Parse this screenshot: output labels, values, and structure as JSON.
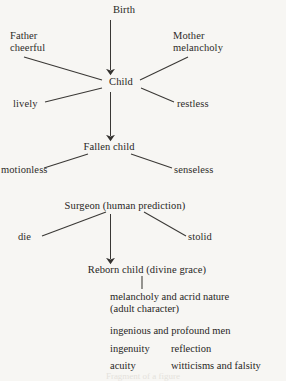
{
  "figure": {
    "type": "flow-diagram",
    "background_color": "#f7f6f3",
    "ink_color": "#282624",
    "nodes": {
      "birth": "Birth",
      "child": "Child",
      "fallen_child": "Fallen child",
      "surgeon": "Surgeon (human prediction)",
      "reborn_child": "Reborn child (divine grace)"
    },
    "branch_labels": {
      "father": "Father\ncheerful",
      "mother": "Mother\nmelancholy",
      "lively": "lively",
      "restless": "restless",
      "motionless": "motionless",
      "senseless": "senseless",
      "die": "die",
      "stolid": "stolid"
    },
    "outcome": {
      "nature_line1": "melancholy and acrid nature",
      "nature_line2": "(adult character)",
      "heading": "ingenious and profound men",
      "traits": [
        {
          "left": "ingenuity",
          "right": "reflection"
        },
        {
          "left": "acuity",
          "right": "witticisms and falsity"
        }
      ]
    },
    "caption_bleed": "Fragment of a figure"
  }
}
